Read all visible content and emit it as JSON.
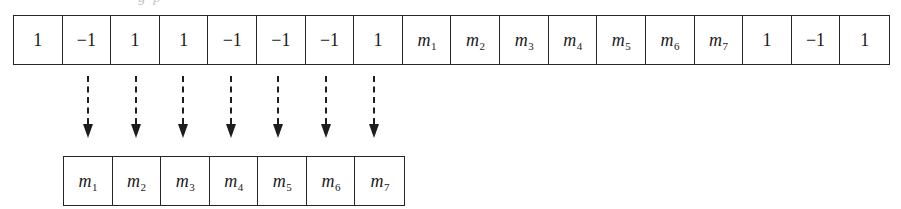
{
  "figure": {
    "name": "sequence-extraction-diagram",
    "cropped_text_above": "g p",
    "colors": {
      "background": "#ffffff",
      "stroke": "#262626",
      "arrow": "#1d1d1d",
      "text": "#1a1a1a"
    }
  },
  "source_array": {
    "label": "source-sequence",
    "cell_count": 18,
    "cells": [
      {
        "text": "1",
        "kind": "number"
      },
      {
        "text": "-1",
        "kind": "number"
      },
      {
        "text": "1",
        "kind": "number"
      },
      {
        "text": "1",
        "kind": "number"
      },
      {
        "text": "-1",
        "kind": "number"
      },
      {
        "text": "-1",
        "kind": "number"
      },
      {
        "text": "-1",
        "kind": "number"
      },
      {
        "text": "1",
        "kind": "number"
      },
      {
        "base": "m",
        "sub": "1",
        "kind": "symbol"
      },
      {
        "base": "m",
        "sub": "2",
        "kind": "symbol"
      },
      {
        "base": "m",
        "sub": "3",
        "kind": "symbol"
      },
      {
        "base": "m",
        "sub": "4",
        "kind": "symbol"
      },
      {
        "base": "m",
        "sub": "5",
        "kind": "symbol"
      },
      {
        "base": "m",
        "sub": "6",
        "kind": "symbol"
      },
      {
        "base": "m",
        "sub": "7",
        "kind": "symbol"
      },
      {
        "text": "1",
        "kind": "number"
      },
      {
        "text": "-1",
        "kind": "number"
      },
      {
        "text": "1",
        "kind": "number"
      }
    ]
  },
  "extracted_array": {
    "label": "extracted-message-sequence",
    "cell_count": 7,
    "cells": [
      {
        "base": "m",
        "sub": "1",
        "kind": "symbol"
      },
      {
        "base": "m",
        "sub": "2",
        "kind": "symbol"
      },
      {
        "base": "m",
        "sub": "3",
        "kind": "symbol"
      },
      {
        "base": "m",
        "sub": "4",
        "kind": "symbol"
      },
      {
        "base": "m",
        "sub": "5",
        "kind": "symbol"
      },
      {
        "base": "m",
        "sub": "6",
        "kind": "symbol"
      },
      {
        "base": "m",
        "sub": "7",
        "kind": "symbol"
      }
    ]
  },
  "arrows": {
    "label": "extraction-arrows",
    "style": "dashed-down-arrow",
    "count": 7,
    "x_positions": [
      88,
      136,
      183,
      231,
      278,
      326,
      374
    ]
  }
}
